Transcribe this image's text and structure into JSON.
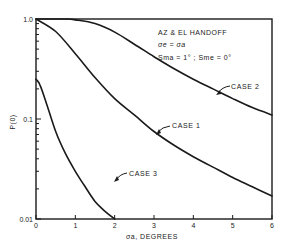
{
  "chart_data": {
    "type": "line",
    "title": "",
    "xlabel": "σa, DEGREES",
    "ylabel": "P(0)",
    "xlim": [
      0,
      6
    ],
    "ylim": [
      0.01,
      1.0
    ],
    "yscale": "log",
    "grid": false,
    "x_ticks": [
      "0",
      "1",
      "2",
      "3",
      "4",
      "5",
      "6"
    ],
    "y_ticks": [
      "0.01",
      "0.1",
      "1.0"
    ],
    "annotations": [
      "AZ & EL HANDOFF",
      "σe = σa",
      "Sma = 1° ; Sme = 0°"
    ],
    "series": [
      {
        "name": "CASE 1",
        "x": [
          0,
          0.5,
          1.0,
          1.5,
          2.0,
          2.5,
          3.0,
          3.5,
          4.0,
          4.5,
          5.0,
          5.5,
          6.0
        ],
        "values": [
          1.0,
          0.75,
          0.45,
          0.26,
          0.16,
          0.11,
          0.075,
          0.055,
          0.042,
          0.033,
          0.026,
          0.021,
          0.017
        ]
      },
      {
        "name": "CASE 2",
        "x": [
          0,
          0.5,
          0.8,
          1.0,
          1.5,
          2.0,
          2.5,
          3.0,
          3.5,
          4.0,
          4.5,
          5.0,
          5.5,
          6.0
        ],
        "values": [
          1.0,
          1.0,
          1.0,
          0.98,
          0.9,
          0.74,
          0.56,
          0.42,
          0.32,
          0.25,
          0.2,
          0.16,
          0.13,
          0.11
        ]
      },
      {
        "name": "CASE 3",
        "x": [
          0,
          0.1,
          0.25,
          0.5,
          0.75,
          1.0,
          1.25,
          1.5,
          1.75,
          2.0
        ],
        "values": [
          0.25,
          0.22,
          0.15,
          0.075,
          0.045,
          0.03,
          0.021,
          0.015,
          0.012,
          0.01
        ]
      }
    ],
    "legend": "none (curves labeled inline)"
  },
  "labels": {
    "y_axis_title": "P(0)",
    "x_axis_title": "σa, DEGREES",
    "anno_line1": "AZ & EL HANDOFF",
    "anno_line2": "σe = σa",
    "anno_line3": "Sma = 1° ; Sme = 0°",
    "case1": "CASE 1",
    "case2": "CASE 2",
    "case3": "CASE 3"
  },
  "colors": {
    "ink": "#1a1a1a",
    "background": "#ffffff"
  }
}
